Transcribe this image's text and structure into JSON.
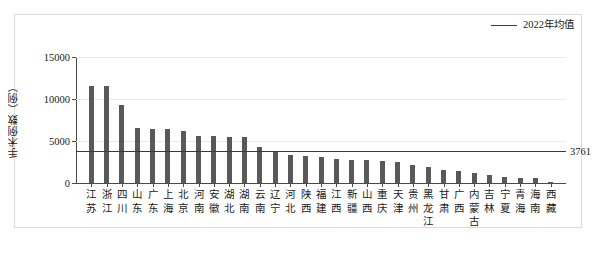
{
  "legend": {
    "series_label": "2022年均值",
    "line_color": "#3a3a3a"
  },
  "axis": {
    "y_title": "手术例数（例）",
    "y_ticks": [
      "0",
      "5000",
      "10000",
      "15000"
    ]
  },
  "mean": {
    "label": "3761"
  },
  "colors": {
    "bar": "#595959",
    "grid": "#e8e8e8",
    "axis": "#4a4a4a",
    "frame": "#dcdcdc"
  },
  "chart_data": {
    "type": "bar",
    "title": "",
    "xlabel": "",
    "ylabel": "手术例数（例）",
    "ylim": [
      0,
      15000
    ],
    "yticks": [
      0,
      5000,
      10000,
      15000
    ],
    "grid": true,
    "legend_position": "top-right",
    "categories": [
      "江苏",
      "浙江",
      "四川",
      "山东",
      "广东",
      "上海",
      "北京",
      "河南",
      "安徽",
      "湖北",
      "湖南",
      "云南",
      "辽宁",
      "河北",
      "陕西",
      "福建",
      "江西",
      "新疆",
      "山西",
      "重庆",
      "天津",
      "贵州",
      "黑龙江",
      "甘肃",
      "广西",
      "内蒙古",
      "吉林",
      "宁夏",
      "青海",
      "海南",
      "西藏"
    ],
    "series": [
      {
        "name": "手术例数",
        "values": [
          11500,
          11550,
          9300,
          6550,
          6400,
          6400,
          6150,
          5600,
          5550,
          5500,
          5450,
          4300,
          3700,
          3300,
          3200,
          3150,
          2900,
          2750,
          2700,
          2600,
          2500,
          2150,
          1850,
          1500,
          1450,
          1150,
          1000,
          700,
          620,
          560,
          180
        ]
      }
    ],
    "reference_line": {
      "name": "2022年均值",
      "value": 3761,
      "label": "3761"
    }
  }
}
